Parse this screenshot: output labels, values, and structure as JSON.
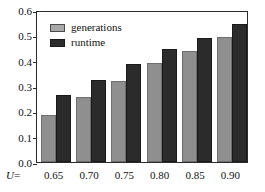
{
  "chart_data": {
    "type": "bar",
    "title": "",
    "subtitle": "",
    "xlabel": "U =",
    "ylabel": "",
    "categories": [
      "0.65",
      "0.70",
      "0.75",
      "0.80",
      "0.85",
      "0.90"
    ],
    "series": [
      {
        "name": "generations",
        "color": "#8f8f8f",
        "values": [
          0.184,
          0.255,
          0.318,
          0.392,
          0.438,
          0.492
        ]
      },
      {
        "name": "runtime",
        "color": "#2b2b2b",
        "values": [
          0.264,
          0.323,
          0.388,
          0.448,
          0.488,
          0.545
        ]
      }
    ],
    "ylim": [
      0.0,
      0.6
    ],
    "yticks": [
      "0.0",
      "0.1",
      "0.2",
      "0.3",
      "0.4",
      "0.5",
      "0.6"
    ],
    "ytick_values": [
      0.0,
      0.1,
      0.2,
      0.3,
      0.4,
      0.5,
      0.6
    ],
    "grid": false,
    "legend_position": "top-left",
    "frame": true
  },
  "legend": {
    "items": [
      {
        "label": "generations",
        "swatch": "legend-swatch-generations"
      },
      {
        "label": "runtime",
        "swatch": "legend-swatch-runtime"
      }
    ]
  },
  "axis": {
    "x_prefix_symbol": "U",
    "x_prefix_equals": "=",
    "tick_color": "#2b2b2b"
  }
}
